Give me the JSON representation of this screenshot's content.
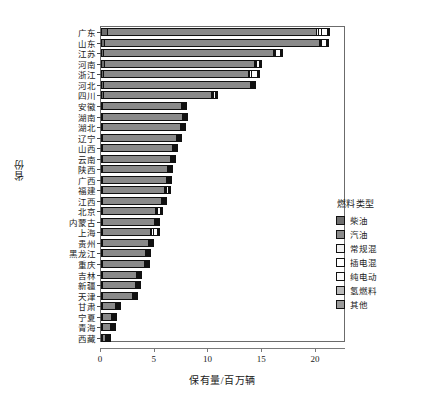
{
  "chart_data": {
    "type": "bar",
    "orientation": "horizontal",
    "stacked": true,
    "title": "",
    "xlabel": "保有量/百万辆",
    "ylabel": "省份",
    "xlim": [
      0,
      22.8
    ],
    "xticks": [
      0,
      5,
      10,
      15,
      20
    ],
    "xticklabels": [
      "0",
      "5",
      "10",
      "15",
      "20"
    ],
    "grid": false,
    "legend": {
      "title": "燃料类型",
      "position": "right",
      "entries": [
        {
          "name": "柴油",
          "color": "#6e6e6e"
        },
        {
          "name": "汽油",
          "color": "#8a8a8a"
        },
        {
          "name": "常规混",
          "color": "#f2f2f2"
        },
        {
          "name": "插电混",
          "color": "#ffffff"
        },
        {
          "name": "纯电动",
          "color": "#fbfbfb"
        },
        {
          "name": "氢燃料",
          "color": "#b9b9b9"
        },
        {
          "name": "其他",
          "color": "#9a9a9a"
        }
      ]
    },
    "categories": [
      "广东",
      "山东",
      "江苏",
      "河南",
      "浙江",
      "河北",
      "四川",
      "安徽",
      "湖南",
      "湖北",
      "辽宁",
      "山西",
      "云南",
      "陕西",
      "广西",
      "福建",
      "江西",
      "北京",
      "内蒙古",
      "上海",
      "贵州",
      "黑龙江",
      "重庆",
      "吉林",
      "新疆",
      "天津",
      "甘肃",
      "宁夏",
      "青海",
      "西藏"
    ],
    "series": [
      {
        "name": "柴油",
        "values": [
          0.62,
          0.36,
          0.32,
          0.34,
          0.3,
          0.32,
          0.28,
          0.2,
          0.22,
          0.22,
          0.18,
          0.22,
          0.2,
          0.22,
          0.2,
          0.18,
          0.16,
          0.14,
          0.22,
          0.16,
          0.18,
          0.2,
          0.14,
          0.16,
          0.22,
          0.12,
          0.16,
          0.08,
          0.08,
          0.06
        ]
      },
      {
        "name": "汽油",
        "values": [
          19.6,
          20.1,
          15.9,
          14.1,
          13.6,
          13.7,
          10.1,
          7.4,
          7.5,
          7.3,
          7.0,
          6.6,
          6.4,
          6.1,
          6.0,
          5.9,
          5.6,
          5.0,
          4.9,
          4.6,
          4.4,
          4.1,
          4.0,
          3.3,
          3.1,
          2.9,
          1.3,
          0.95,
          0.8,
          0.4
        ]
      },
      {
        "name": "常规混",
        "values": [
          0.22,
          0.1,
          0.09,
          0.06,
          0.1,
          0.05,
          0.06,
          0.05,
          0.05,
          0.05,
          0.04,
          0.03,
          0.04,
          0.04,
          0.04,
          0.05,
          0.04,
          0.09,
          0.02,
          0.1,
          0.03,
          0.02,
          0.04,
          0.02,
          0.02,
          0.03,
          0.01,
          0.01,
          0.01,
          0.01
        ]
      },
      {
        "name": "插电混",
        "values": [
          0.4,
          0.12,
          0.16,
          0.09,
          0.22,
          0.07,
          0.1,
          0.08,
          0.07,
          0.07,
          0.05,
          0.04,
          0.05,
          0.06,
          0.05,
          0.07,
          0.05,
          0.14,
          0.03,
          0.22,
          0.04,
          0.03,
          0.06,
          0.03,
          0.02,
          0.04,
          0.02,
          0.01,
          0.01,
          0.01
        ]
      },
      {
        "name": "纯电动",
        "values": [
          0.66,
          0.58,
          0.55,
          0.32,
          0.7,
          0.26,
          0.32,
          0.22,
          0.22,
          0.24,
          0.16,
          0.14,
          0.18,
          0.2,
          0.18,
          0.24,
          0.16,
          0.44,
          0.1,
          0.44,
          0.14,
          0.1,
          0.22,
          0.09,
          0.08,
          0.14,
          0.06,
          0.04,
          0.03,
          0.02
        ]
      },
      {
        "name": "氢燃料",
        "values": [
          0.01,
          0.01,
          0.01,
          0.01,
          0.01,
          0.01,
          0.01,
          0.01,
          0.01,
          0.01,
          0.01,
          0.01,
          0.01,
          0.01,
          0.01,
          0.01,
          0.01,
          0.01,
          0.01,
          0.01,
          0.01,
          0.01,
          0.01,
          0.01,
          0.01,
          0.01,
          0.01,
          0.01,
          0.01,
          0.01
        ]
      },
      {
        "name": "其他",
        "values": [
          0.04,
          0.03,
          0.02,
          0.02,
          0.02,
          0.02,
          0.02,
          0.02,
          0.02,
          0.02,
          0.02,
          0.02,
          0.02,
          0.02,
          0.02,
          0.02,
          0.02,
          0.02,
          0.02,
          0.02,
          0.02,
          0.02,
          0.02,
          0.02,
          0.02,
          0.02,
          0.01,
          0.01,
          0.01,
          0.01
        ]
      }
    ],
    "totals": [
      21.55,
      21.3,
      17.05,
      14.94,
      14.95,
      14.43,
      10.89,
      7.98,
      8.09,
      7.91,
      7.46,
      7.04,
      6.9,
      6.65,
      6.5,
      6.47,
      6.04,
      5.84,
      5.3,
      5.55,
      4.82,
      4.48,
      4.49,
      3.63,
      3.47,
      3.24,
      1.57,
      1.11,
      0.95,
      0.52
    ]
  }
}
